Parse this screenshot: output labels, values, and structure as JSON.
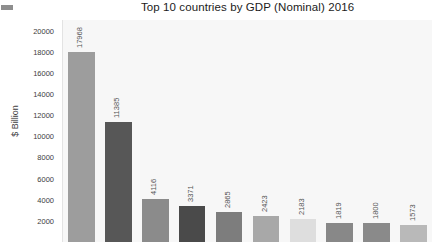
{
  "chart_data": {
    "type": "bar",
    "title": "Top 10 countries by GDP (Nominal) 2016",
    "xlabel": "",
    "ylabel": "$ Billion",
    "ylim": [
      0,
      21000
    ],
    "grid": false,
    "legend": "none",
    "categories": [
      "",
      "",
      "",
      "",
      "",
      "",
      "",
      "",
      "",
      ""
    ],
    "values": [
      17968,
      11385,
      4116,
      3371,
      2865,
      2423,
      2183,
      1819,
      1800,
      1573
    ],
    "value_labels": [
      "17968",
      "11385",
      "4116",
      "3371",
      "2865",
      "2423",
      "2183",
      "1819",
      "1800",
      "1573"
    ],
    "bar_colors": [
      "#9d9d9d",
      "#575757",
      "#8b8b8b",
      "#4a4a4a",
      "#7d7d7d",
      "#a8a8a8",
      "#dedede",
      "#888888",
      "#8a8a8a",
      "#b9b9b9"
    ],
    "yticks": [
      20000,
      18000,
      16000,
      14000,
      12000,
      10000,
      8000,
      6000,
      4000,
      2000
    ],
    "ytick_labels": [
      "20000",
      "18000",
      "16000",
      "14000",
      "12000",
      "10000",
      "8000",
      "6000",
      "4000",
      "2000"
    ],
    "plot_background": "#f7f7f7",
    "page_background": "#ffffff",
    "label_color": "#555555",
    "axis_text_color": "#3d3d3d",
    "note": "chart is cropped at the bottom; x-axis category labels are not visible"
  },
  "artifacts": {
    "corner_mark": ""
  }
}
